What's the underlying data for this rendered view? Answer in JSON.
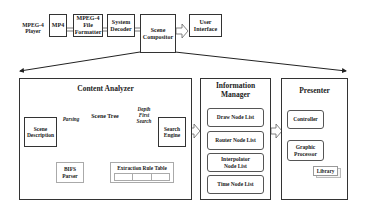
{
  "diagram": {
    "top_row": {
      "player_label": "MPEG-4\nPlayer",
      "boxes": [
        {
          "id": "mp4",
          "label": "MP4"
        },
        {
          "id": "file_formatter",
          "label": "MPEG-4\nFile\nFormatter"
        },
        {
          "id": "system_decoder",
          "label": "System\nDecoder"
        },
        {
          "id": "scene_compositor",
          "label": "Scene\nCompositor"
        },
        {
          "id": "user_interface",
          "label": "User\nInterface"
        }
      ]
    },
    "content_analyzer": {
      "title": "Content Analyzer",
      "scene_description": "Scene\nDescription",
      "parsing_label": "Parsing",
      "scene_tree_label": "Scene Tree",
      "dfs_label": "Depth\nFirst\nSearch",
      "search_engine": "Search\nEngine",
      "bifs_parser": "BIFS\nParser",
      "extraction_rule_table": "Extraction Rule Table"
    },
    "information_manager": {
      "title": "Information\nManager",
      "lists": [
        "Draw Node List",
        "Router Node List",
        "Interpolator\nNode List",
        "Time Node List"
      ]
    },
    "presenter": {
      "title": "Presenter",
      "controller": "Controller",
      "graphic_processor": "Graphic\nProcessor",
      "library": "Library"
    }
  }
}
